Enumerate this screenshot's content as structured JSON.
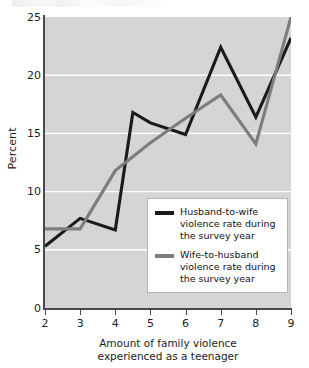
{
  "chart_data": {
    "type": "line",
    "title": "",
    "subtitle": "",
    "xlabel_lines": [
      "Amount of family violence",
      "experienced as a teenager"
    ],
    "ylabel": "Percent",
    "xlim": [
      2,
      9
    ],
    "ylim": [
      0,
      25
    ],
    "x_ticks": [
      2,
      3,
      4,
      5,
      6,
      7,
      8,
      9
    ],
    "y_ticks": [
      0,
      5,
      10,
      15,
      20,
      25
    ],
    "grid": "horizontal-white",
    "legend_position": "lower-right-inside",
    "plot_background": "#d5d5d5",
    "series": [
      {
        "name": "Husband-to-wife violence rate during the survey year",
        "legend_lines": [
          "Husband-to-wife",
          "violence rate during",
          "the survey year"
        ],
        "color": "#1a1a1a",
        "x": [
          2,
          3,
          4,
          4.5,
          5,
          6,
          7,
          8,
          9
        ],
        "values": [
          5.3,
          7.7,
          6.7,
          16.8,
          15.9,
          14.9,
          22.4,
          16.4,
          23.2
        ]
      },
      {
        "name": "Wife-to-husband violence rate during the survey year",
        "legend_lines": [
          "Wife-to-husband",
          "violence rate during",
          "the survey year"
        ],
        "color": "#7d7d7d",
        "x": [
          2,
          3,
          4,
          5,
          6,
          7,
          8,
          9
        ],
        "values": [
          6.8,
          6.8,
          11.8,
          14.2,
          16.3,
          18.3,
          14.1,
          25.0
        ]
      }
    ]
  },
  "axis": {
    "y_tick_labels": [
      "25",
      "20",
      "15",
      "10",
      "5",
      "0"
    ],
    "x_tick_labels": [
      "2",
      "3",
      "4",
      "5",
      "6",
      "7",
      "8",
      "9"
    ],
    "y_title": "Percent",
    "x_title_line1": "Amount of family violence",
    "x_title_line2": "experienced as a teenager"
  },
  "legend": {
    "entries": [
      {
        "color": "#1a1a1a",
        "line1": "Husband-to-wife",
        "line2": "violence rate during",
        "line3": "the survey year"
      },
      {
        "color": "#7d7d7d",
        "line1": "Wife-to-husband",
        "line2": "violence rate during",
        "line3": "the survey year"
      }
    ]
  }
}
